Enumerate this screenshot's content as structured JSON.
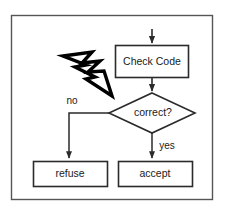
{
  "canvas": {
    "width": 227,
    "height": 212,
    "background": "#ffffff"
  },
  "frame": {
    "name": "outer-border",
    "x": 11,
    "y": 15,
    "width": 202,
    "height": 185,
    "stroke": "#555555",
    "fill": "#ffffff"
  },
  "diagram": {
    "type": "flowchart",
    "title": "",
    "stroke": "#2b2b2b",
    "fill": "#ffffff",
    "nodes": [
      {
        "id": "check-code",
        "shape": "rectangle",
        "label": "Check Code",
        "x": 115,
        "y": 45,
        "width": 74,
        "height": 33
      },
      {
        "id": "correct",
        "shape": "diamond",
        "label": "correct?",
        "cx": 152,
        "cy": 113,
        "rx": 43,
        "ry": 20
      },
      {
        "id": "refuse",
        "shape": "rectangle",
        "label": "refuse",
        "x": 33,
        "y": 161,
        "width": 75,
        "height": 26
      },
      {
        "id": "accept",
        "shape": "rectangle",
        "label": "accept",
        "x": 118,
        "y": 161,
        "width": 75,
        "height": 26
      }
    ],
    "edges": [
      {
        "id": "entry-to-check-code",
        "from": "",
        "to": "check-code",
        "label": "",
        "arrow": true
      },
      {
        "id": "check-code-to-correct",
        "from": "check-code",
        "to": "correct",
        "label": "",
        "arrow": true
      },
      {
        "id": "correct-to-refuse",
        "from": "correct",
        "to": "refuse",
        "label": "no",
        "label_x": 72,
        "label_y": 101,
        "arrow": true
      },
      {
        "id": "correct-to-accept",
        "from": "correct",
        "to": "accept",
        "label": "yes",
        "label_x": 167,
        "label_y": 146,
        "arrow": true
      }
    ],
    "annotations": [
      {
        "id": "attack-bolt",
        "name": "lightning-bolt-icon",
        "meaning": "attack",
        "label": "",
        "target": "correct",
        "fill": "#ffffff",
        "stroke": "#000000"
      }
    ]
  }
}
